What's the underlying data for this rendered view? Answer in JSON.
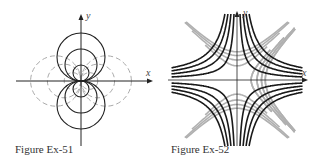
{
  "figures": [
    {
      "id": "ex51",
      "caption": "Figure Ex-51",
      "x_axis_label": "x",
      "y_axis_label": "y",
      "description": "Two families of circles tangent at the origin: solid black circles centered on the y-axis, dashed gray circles centered on the x-axis",
      "solid_circle_radii": [
        1,
        2,
        3
      ],
      "dashed_circle_radii": [
        1,
        2,
        3
      ],
      "colors": {
        "solid": "#222222",
        "dashed": "#aaaaaa",
        "axes": "#222222"
      }
    },
    {
      "id": "ex52",
      "caption": "Figure Ex-52",
      "x_axis_label": "x",
      "y_axis_label": "y",
      "description": "Two families of hyperbolas: black curves xy = c asymptotic to the axes, gray curves x^2 - y^2 = c rotated 45 degrees",
      "black_levels": [
        0.5,
        1,
        1.5,
        2
      ],
      "gray_levels": [
        0.5,
        1,
        1.5,
        2
      ],
      "colors": {
        "black": "#1a1a1a",
        "gray": "#b0b0b0",
        "axes": "#222222"
      }
    }
  ]
}
